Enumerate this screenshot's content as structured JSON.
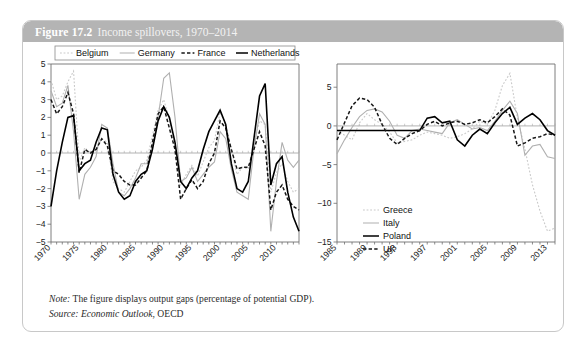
{
  "figure": {
    "number": "Figure 17.2",
    "caption": "Income spillovers, 1970–2014",
    "note": "Note: The figure displays output gaps (percentage of potential GDP).",
    "note_label": "Note:",
    "note_text": " The figure displays output gaps (percentage of potential GDP).",
    "source_label": "Source:",
    "source_em": " Economic Outlook",
    "source_rest": ", OECD",
    "header_color": "#b4b4b4",
    "border_color": "#c8c8c8"
  },
  "chart_data": [
    {
      "id": "left",
      "type": "line",
      "title": "",
      "xlabel": "",
      "ylabel": "",
      "xlim": [
        1970,
        2014
      ],
      "ylim": [
        -5,
        5
      ],
      "ytick_values": [
        5,
        4,
        3,
        2,
        1,
        0,
        -1,
        -2,
        -3,
        -4,
        -5
      ],
      "ytick_labels": [
        "5",
        "4",
        "3",
        "2",
        "1",
        "0",
        "−1",
        "−2",
        "−3",
        "−4",
        "−5"
      ],
      "xtick_values": [
        1970,
        1975,
        1980,
        1985,
        1990,
        1995,
        2000,
        2005,
        2010
      ],
      "xtick_labels": [
        "1970",
        "1975",
        "1980",
        "1985",
        "1990",
        "1995",
        "2000",
        "2005",
        "2010"
      ],
      "grid": false,
      "legend_position": "top",
      "x": [
        1970,
        1971,
        1972,
        1973,
        1974,
        1975,
        1976,
        1977,
        1978,
        1979,
        1980,
        1981,
        1982,
        1983,
        1984,
        1985,
        1986,
        1987,
        1988,
        1989,
        1990,
        1991,
        1992,
        1993,
        1994,
        1995,
        1996,
        1997,
        1998,
        1999,
        2000,
        2001,
        2002,
        2003,
        2004,
        2005,
        2006,
        2007,
        2008,
        2009,
        2010,
        2011,
        2012,
        2013,
        2014
      ],
      "series": [
        {
          "name": "Belgium",
          "style": "dotted",
          "color": "#c9c9c9",
          "values": [
            4.1,
            3.0,
            3.2,
            4.0,
            4.6,
            -0.5,
            0.3,
            0.0,
            0.2,
            0.8,
            0.6,
            -1.6,
            -2.0,
            -2.2,
            -1.6,
            -1.0,
            -0.8,
            -0.4,
            1.0,
            2.4,
            3.0,
            1.9,
            0.4,
            -1.8,
            -1.2,
            -0.7,
            -1.3,
            -0.5,
            0.3,
            0.7,
            2.3,
            1.6,
            0.2,
            -1.2,
            -0.8,
            -0.9,
            0.5,
            1.8,
            1.6,
            -2.2,
            -1.1,
            -0.6,
            -1.6,
            -2.2,
            -2.0
          ]
        },
        {
          "name": "Germany",
          "style": "gray-solid",
          "color": "#b0b0b0",
          "values": [
            3.5,
            2.6,
            2.8,
            3.8,
            1.2,
            -2.6,
            -1.2,
            -0.8,
            -0.2,
            1.6,
            1.4,
            -0.6,
            -2.2,
            -2.4,
            -2.0,
            -1.4,
            -0.6,
            -0.6,
            0.4,
            2.0,
            4.2,
            4.5,
            2.0,
            -1.6,
            -1.4,
            -0.8,
            -1.6,
            -1.2,
            -0.8,
            -0.5,
            1.2,
            0.8,
            -0.9,
            -2.2,
            -2.4,
            -2.6,
            0.2,
            2.2,
            1.6,
            -4.4,
            -1.6,
            0.6,
            -0.4,
            -0.8,
            -0.4
          ]
        },
        {
          "name": "France",
          "style": "dashed",
          "color": "#161616",
          "values": [
            3.0,
            2.2,
            2.6,
            3.4,
            2.2,
            -1.1,
            0.2,
            0.0,
            0.2,
            0.8,
            0.4,
            -1.0,
            -1.2,
            -1.6,
            -1.8,
            -1.8,
            -1.4,
            -1.0,
            0.6,
            2.2,
            2.6,
            1.4,
            0.2,
            -2.6,
            -2.0,
            -1.5,
            -2.0,
            -1.6,
            -0.6,
            0.0,
            1.8,
            1.4,
            0.2,
            -0.9,
            -0.8,
            -0.8,
            0.2,
            1.2,
            0.4,
            -3.2,
            -2.2,
            -1.8,
            -2.6,
            -3.0,
            -3.2
          ]
        },
        {
          "name": "Netherlands",
          "style": "black-solid",
          "color": "#000000",
          "values": [
            -3.0,
            -1.0,
            0.6,
            2.0,
            2.1,
            -1.0,
            -0.6,
            -0.4,
            0.6,
            1.4,
            1.3,
            -1.2,
            -2.2,
            -2.6,
            -2.4,
            -1.6,
            -1.2,
            -1.0,
            0.2,
            1.8,
            2.6,
            2.0,
            0.6,
            -1.6,
            -2.0,
            -1.4,
            -1.0,
            0.2,
            1.2,
            1.8,
            2.4,
            1.6,
            -0.6,
            -2.0,
            -2.2,
            -1.6,
            0.8,
            3.2,
            3.9,
            -1.8,
            -0.6,
            -0.2,
            -2.2,
            -3.6,
            -4.4
          ]
        }
      ]
    },
    {
      "id": "right",
      "type": "line",
      "title": "",
      "xlabel": "",
      "ylabel": "",
      "xlim": [
        1985,
        2014
      ],
      "ylim": [
        -15,
        8
      ],
      "ytick_values": [
        5,
        0,
        -5,
        -10,
        -15
      ],
      "ytick_labels": [
        "5",
        "0",
        "−5",
        "−10",
        "−15"
      ],
      "xtick_values": [
        1985,
        1989,
        1993,
        1997,
        2001,
        2005,
        2009,
        2013
      ],
      "xtick_labels": [
        "1985",
        "1989",
        "1993",
        "1997",
        "2001",
        "2005",
        "2009",
        "2013"
      ],
      "grid": false,
      "legend_position": "bottom-left",
      "x": [
        1985,
        1986,
        1987,
        1988,
        1989,
        1990,
        1991,
        1992,
        1993,
        1994,
        1995,
        1996,
        1997,
        1998,
        1999,
        2000,
        2001,
        2002,
        2003,
        2004,
        2005,
        2006,
        2007,
        2008,
        2009,
        2010,
        2011,
        2012,
        2013,
        2014
      ],
      "series": [
        {
          "name": "Greece",
          "style": "dotted",
          "color": "#c9c9c9",
          "values": [
            -0.6,
            -1.2,
            -1.8,
            0.4,
            1.6,
            0.8,
            0.2,
            -0.8,
            -2.2,
            -2.0,
            -1.8,
            -1.2,
            -0.8,
            -1.0,
            -1.2,
            -1.6,
            -1.4,
            -1.0,
            -0.4,
            0.6,
            0.2,
            2.0,
            5.2,
            6.8,
            1.0,
            -3.0,
            -7.6,
            -11.0,
            -13.6,
            -13.2
          ]
        },
        {
          "name": "Italy",
          "style": "gray-solid",
          "color": "#b0b0b0",
          "values": [
            -3.6,
            -1.8,
            -0.2,
            1.2,
            2.0,
            2.2,
            1.8,
            0.6,
            -1.2,
            -1.6,
            -0.6,
            -0.4,
            -0.6,
            -0.8,
            -1.0,
            0.4,
            0.8,
            0.2,
            -0.4,
            -0.2,
            -0.6,
            0.6,
            2.0,
            3.2,
            1.6,
            -3.8,
            -2.6,
            -2.4,
            -4.0,
            -4.2,
            -3.6
          ]
        },
        {
          "name": "Poland",
          "style": "black-solid",
          "color": "#000000",
          "values": [
            -0.6,
            -0.6,
            -0.6,
            -0.6,
            -0.6,
            -0.6,
            -0.6,
            -0.6,
            -0.6,
            -0.6,
            -0.6,
            -0.6,
            1.0,
            1.2,
            0.4,
            0.6,
            -1.8,
            -2.6,
            -1.2,
            -0.4,
            -1.0,
            0.4,
            1.6,
            2.4,
            0.2,
            1.0,
            1.6,
            0.8,
            -0.6,
            -1.2,
            -0.8
          ]
        },
        {
          "name": "UK",
          "style": "dashed",
          "color": "#161616",
          "values": [
            -1.8,
            0.4,
            2.6,
            3.6,
            3.4,
            2.4,
            0.2,
            -1.6,
            -2.4,
            -1.6,
            -1.0,
            -0.6,
            0.2,
            0.6,
            0.0,
            0.4,
            0.6,
            0.2,
            0.4,
            0.8,
            0.4,
            1.2,
            2.2,
            1.4,
            -2.6,
            -2.2,
            -1.6,
            -1.4,
            -1.0,
            -1.2
          ]
        }
      ]
    }
  ]
}
